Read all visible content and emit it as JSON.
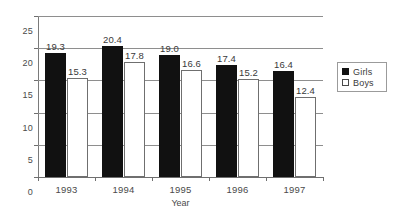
{
  "chart_data": {
    "type": "bar",
    "title": "",
    "subtitle": "",
    "xlabel": "Year",
    "ylabel": "",
    "categories": [
      "1993",
      "1994",
      "1995",
      "1996",
      "1997"
    ],
    "series": [
      {
        "name": "Girls",
        "color": "#111111",
        "values": [
          19.3,
          20.4,
          19.0,
          17.4,
          16.4
        ],
        "labels": [
          "19.3",
          "20.4",
          "19.0",
          "17.4",
          "16.4"
        ]
      },
      {
        "name": "Boys",
        "color": "#ffffff",
        "values": [
          15.3,
          17.8,
          16.6,
          15.2,
          12.4
        ],
        "labels": [
          "15.3",
          "17.8",
          "16.6",
          "15.2",
          "12.4"
        ]
      }
    ],
    "ylim": [
      0,
      25
    ],
    "yticks": [
      0,
      5,
      10,
      15,
      20,
      25
    ],
    "ytick_labels": [
      "0",
      "5",
      "10",
      "15",
      "20",
      "25"
    ],
    "grid": true,
    "grid_axis": "y",
    "legend_position": "right",
    "legend": [
      "Girls",
      "Boys"
    ]
  },
  "legend": {
    "entries": [
      {
        "label": "Girls",
        "swatch": "filled-square-icon"
      },
      {
        "label": "Boys",
        "swatch": "empty-square-icon"
      }
    ]
  }
}
